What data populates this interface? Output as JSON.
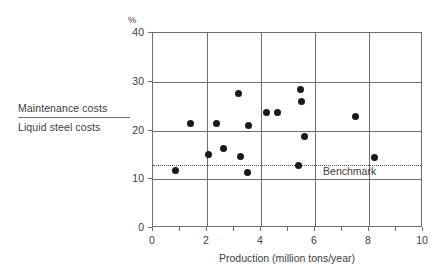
{
  "chart_data": {
    "type": "scatter",
    "title": "",
    "ylabel_numerator": "Maintenance costs",
    "ylabel_denominator": "Liquid steel costs",
    "yunit": "%",
    "xlabel": "Production (million tons/year)",
    "xlim": [
      0,
      10
    ],
    "ylim": [
      0,
      40
    ],
    "xticks": [
      0,
      2,
      4,
      6,
      8,
      10
    ],
    "xtick_labels": [
      "0",
      "2",
      "4",
      "6",
      "8",
      "10"
    ],
    "yticks": [
      0,
      10,
      20,
      30,
      40
    ],
    "ytick_labels": [
      "0",
      "10",
      "20",
      "30",
      "40"
    ],
    "xminor_step": 1,
    "grid": true,
    "grid_x_values": [
      2,
      4,
      6,
      8
    ],
    "grid_y_values": [
      10,
      20,
      30
    ],
    "legend_position": "none",
    "marker_color": "#1a1a1a",
    "grid_color": "#6e6e6e",
    "points": [
      {
        "x": 0.85,
        "y": 11.7
      },
      {
        "x": 1.4,
        "y": 21.5
      },
      {
        "x": 2.05,
        "y": 15.0
      },
      {
        "x": 2.35,
        "y": 21.4
      },
      {
        "x": 2.6,
        "y": 16.3
      },
      {
        "x": 3.15,
        "y": 27.5
      },
      {
        "x": 3.25,
        "y": 14.7
      },
      {
        "x": 3.5,
        "y": 11.3
      },
      {
        "x": 3.55,
        "y": 21.1
      },
      {
        "x": 4.2,
        "y": 23.6
      },
      {
        "x": 4.6,
        "y": 23.6
      },
      {
        "x": 5.4,
        "y": 12.9
      },
      {
        "x": 5.45,
        "y": 28.4
      },
      {
        "x": 5.5,
        "y": 25.9
      },
      {
        "x": 5.6,
        "y": 18.8
      },
      {
        "x": 7.5,
        "y": 22.8
      },
      {
        "x": 8.2,
        "y": 14.4
      }
    ],
    "annotations": [
      {
        "type": "hline",
        "label": "Benchmark",
        "value": 13.0,
        "style": "dotted",
        "color": "#4d4d4d",
        "label_x": 6.3,
        "label_y": 11.6
      }
    ]
  }
}
